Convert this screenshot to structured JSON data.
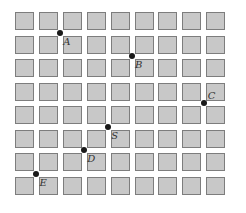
{
  "diagram": {
    "title": "",
    "grid": {
      "columns": 9,
      "rows": 8,
      "cell_fill": "#c8c8c8",
      "cell_border": "#7d7d7d",
      "origin_x": 15,
      "origin_y": 12,
      "pitch_x": 23.9,
      "pitch_y": 23.5,
      "cell_w": 19,
      "cell_h": 18
    },
    "points": [
      {
        "label": "A",
        "col_gap": 2,
        "row_gap": 1
      },
      {
        "label": "B",
        "col_gap": 5,
        "row_gap": 2
      },
      {
        "label": "C",
        "col_gap": 8,
        "row_gap": 4
      },
      {
        "label": "S",
        "col_gap": 4,
        "row_gap": 5
      },
      {
        "label": "D",
        "col_gap": 3,
        "row_gap": 6
      },
      {
        "label": "E",
        "col_gap": 1,
        "row_gap": 7
      }
    ],
    "point_color": "#1a1a1a"
  }
}
